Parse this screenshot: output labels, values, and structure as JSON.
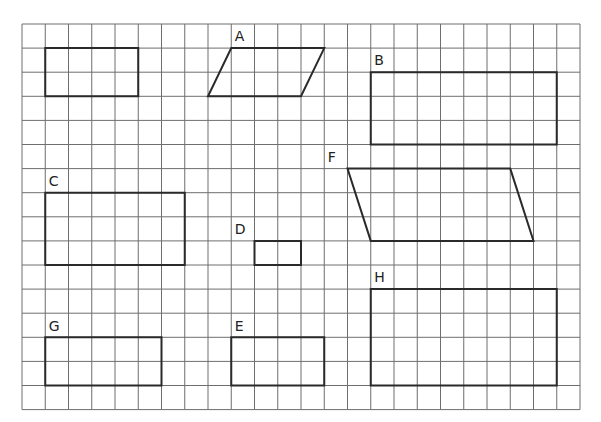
{
  "grid": {
    "origin_x": 22,
    "origin_y": 24,
    "cols": 24,
    "rows": 16,
    "cell_w": 23.25,
    "cell_h": 24.1,
    "line_color": "#6e6e6e",
    "shape_color": "#2a2a2a"
  },
  "shapes": [
    {
      "label": "",
      "type": "rectangle",
      "points": [
        [
          1,
          1
        ],
        [
          5,
          1
        ],
        [
          5,
          3
        ],
        [
          1,
          3
        ]
      ],
      "label_at": null
    },
    {
      "label": "A",
      "type": "parallelogram",
      "points": [
        [
          9,
          1
        ],
        [
          13,
          1
        ],
        [
          12,
          3
        ],
        [
          8,
          3
        ]
      ],
      "label_at": [
        9.15,
        0.72
      ]
    },
    {
      "label": "B",
      "type": "rectangle",
      "points": [
        [
          15,
          2
        ],
        [
          23,
          2
        ],
        [
          23,
          5
        ],
        [
          15,
          5
        ]
      ],
      "label_at": [
        15.15,
        1.72
      ]
    },
    {
      "label": "F",
      "type": "parallelogram",
      "points": [
        [
          14,
          6
        ],
        [
          21,
          6
        ],
        [
          22,
          9
        ],
        [
          15,
          9
        ]
      ],
      "label_at": [
        13.15,
        5.72
      ]
    },
    {
      "label": "C",
      "type": "rectangle",
      "points": [
        [
          1,
          7
        ],
        [
          7,
          7
        ],
        [
          7,
          10
        ],
        [
          1,
          10
        ]
      ],
      "label_at": [
        1.15,
        6.72
      ]
    },
    {
      "label": "D",
      "type": "rectangle",
      "points": [
        [
          10,
          9
        ],
        [
          12,
          9
        ],
        [
          12,
          10
        ],
        [
          10,
          10
        ]
      ],
      "label_at": [
        9.15,
        8.72
      ]
    },
    {
      "label": "H",
      "type": "rectangle",
      "points": [
        [
          15,
          11
        ],
        [
          23,
          11
        ],
        [
          23,
          15
        ],
        [
          15,
          15
        ]
      ],
      "label_at": [
        15.15,
        10.72
      ]
    },
    {
      "label": "G",
      "type": "rectangle",
      "points": [
        [
          1,
          13
        ],
        [
          6,
          13
        ],
        [
          6,
          15
        ],
        [
          1,
          15
        ]
      ],
      "label_at": [
        1.15,
        12.72
      ]
    },
    {
      "label": "E",
      "type": "rectangle",
      "points": [
        [
          9,
          13
        ],
        [
          13,
          13
        ],
        [
          13,
          15
        ],
        [
          9,
          15
        ]
      ],
      "label_at": [
        9.15,
        12.72
      ]
    }
  ]
}
